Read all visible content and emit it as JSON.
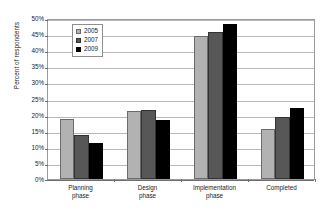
{
  "chart_data": {
    "type": "bar",
    "title": "",
    "xlabel": "",
    "ylabel": "Percent of respondents",
    "ylim": [
      0,
      50
    ],
    "y_tick_labels": [
      "50%",
      "45%",
      "40%",
      "35%",
      "30%",
      "25%",
      "20%",
      "15%",
      "10%",
      "5%",
      "0%"
    ],
    "y_tick_values": [
      50,
      45,
      40,
      35,
      30,
      25,
      20,
      15,
      10,
      5,
      0
    ],
    "grid": true,
    "legend_position": "upper-left-inside",
    "categories": [
      "Planning phase",
      "Design phase",
      "Implementation phase",
      "Completed"
    ],
    "category_lines": [
      [
        "Planning",
        "phase"
      ],
      [
        "Design",
        "phase"
      ],
      [
        "Implementation",
        "phase"
      ],
      [
        "Completed",
        ""
      ]
    ],
    "series": [
      {
        "name": "2005",
        "color": "#b2b2b2",
        "values": [
          18.7,
          21.0,
          44.5,
          15.6
        ]
      },
      {
        "name": "2007",
        "color": "#575757",
        "values": [
          13.7,
          21.4,
          45.6,
          19.2
        ]
      },
      {
        "name": "2009",
        "color": "#000000",
        "values": [
          11.2,
          18.3,
          48.0,
          22.2
        ]
      }
    ],
    "value_unit": "%"
  },
  "legend": {
    "entries": [
      {
        "label": "2005"
      },
      {
        "label": "2007"
      },
      {
        "label": "2009"
      }
    ]
  },
  "colors": {
    "series_2005": "#b2b2b2",
    "series_2007": "#575757",
    "series_2009": "#000000",
    "gridline": "#b8b8b8",
    "axis": "#6e6e6e",
    "plot_border": "#9a9a9a",
    "background": "#ffffff",
    "text": "#1a1a1a"
  }
}
